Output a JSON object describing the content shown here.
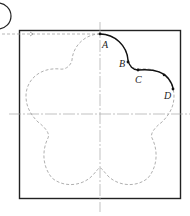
{
  "diagram": {
    "type": "technical drawing",
    "points": [
      {
        "id": "A",
        "label": "A"
      },
      {
        "id": "B",
        "label": "B"
      },
      {
        "id": "C",
        "label": "C"
      },
      {
        "id": "D",
        "label": "D"
      }
    ],
    "colors": {
      "outline": "#222222",
      "dashed": "#9a9a9a",
      "centerline": "#a0a0a0",
      "path": "#111111"
    }
  }
}
